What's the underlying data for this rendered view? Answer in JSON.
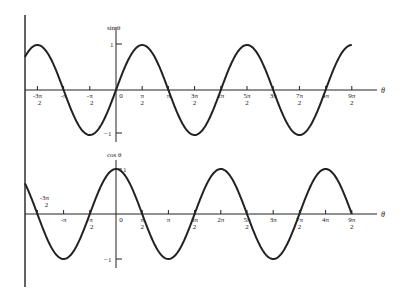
{
  "chart_data": [
    {
      "type": "line",
      "title": "sin θ",
      "function": "sin",
      "xlabel": "θ",
      "ylabel": "sin θ",
      "ylim": [
        -1,
        1
      ],
      "y_ticks": [
        "1",
        "-1"
      ],
      "x_range_rad": [
        -5.46,
        14.137
      ],
      "x_tick_labels": [
        "-3π/2",
        "-π",
        "-π/2",
        "0",
        "π/2",
        "π",
        "3π/2",
        "2π",
        "5π/2",
        "3π",
        "7π/2",
        "4π",
        "9π/2"
      ],
      "x_tick_values_over_pi": [
        -1.5,
        -1,
        -0.5,
        0,
        0.5,
        1,
        1.5,
        2,
        2.5,
        3,
        3.5,
        4,
        4.5
      ],
      "grid": false
    },
    {
      "type": "line",
      "title": "cos θ",
      "function": "cos",
      "xlabel": "θ",
      "ylabel": "cos θ",
      "ylim": [
        -1,
        1
      ],
      "y_ticks": [
        "1",
        "-1"
      ],
      "x_range_rad": [
        -5.46,
        14.137
      ],
      "x_tick_labels": [
        "-3π/2",
        "-π",
        "-π/2",
        "0",
        "π/2",
        "π",
        "3π/2",
        "2π",
        "5π/2",
        "3π",
        "7π/2",
        "4π",
        "9π/2"
      ],
      "x_tick_values_over_pi": [
        -1.5,
        -1,
        -0.5,
        0,
        0.5,
        1,
        1.5,
        2,
        2.5,
        3,
        3.5,
        4,
        4.5
      ],
      "grid": false
    }
  ],
  "labels": {
    "sin_axis": "sin θ",
    "cos_axis": "cos θ",
    "theta": "θ",
    "one": "1",
    "minus_one": "−1",
    "zero": "0"
  },
  "colors": {
    "curve": "#222222",
    "axis": "#222222",
    "background": "#ffffff"
  }
}
